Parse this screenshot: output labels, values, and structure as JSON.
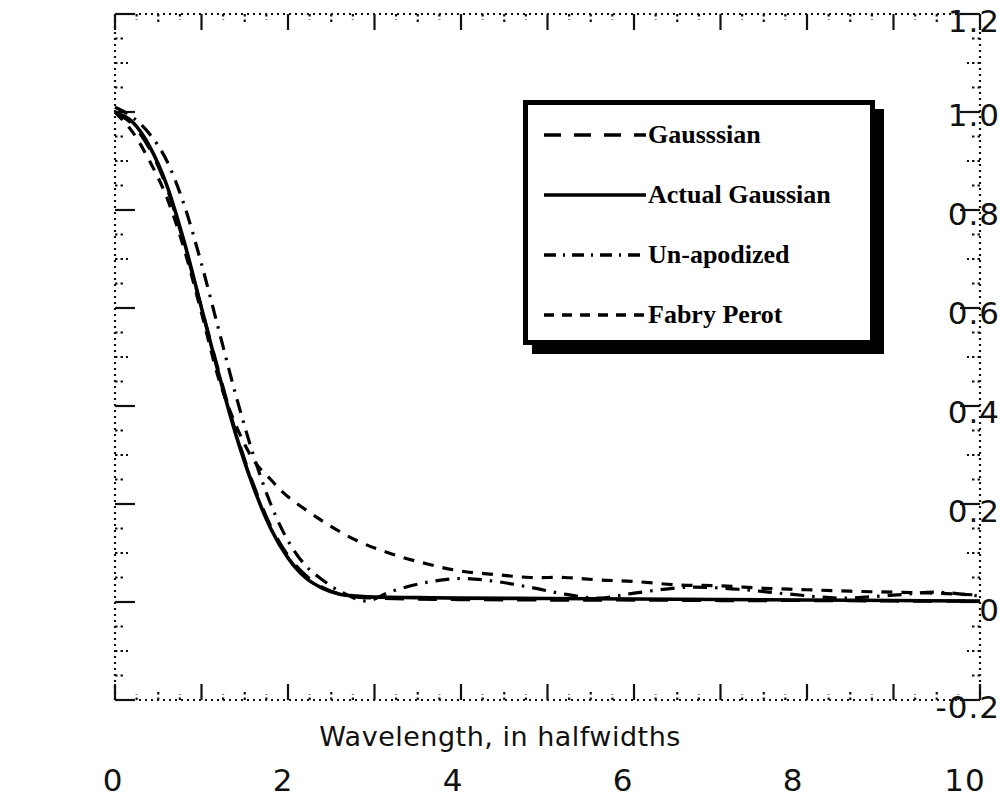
{
  "chart_data": {
    "type": "line",
    "title": "",
    "xlabel": "Wavelength, in halfwidths",
    "ylabel": "",
    "xlim": [
      0,
      10
    ],
    "ylim": [
      -0.2,
      1.2
    ],
    "xticks": [
      0,
      2,
      4,
      6,
      8,
      10
    ],
    "yticks": [
      -0.2,
      0,
      0.2,
      0.4,
      0.6,
      0.8,
      1.0,
      1.2
    ],
    "xtick_labels": [
      "0",
      "2",
      "4",
      "6",
      "8",
      "10"
    ],
    "ytick_labels": [
      "-0.2",
      "0",
      "0.2",
      "0.4",
      "0.6",
      "0.8",
      "1.0",
      "1.2"
    ],
    "grid": false,
    "frame": "dotted",
    "legend_position": "upper-right-inset",
    "series": [
      {
        "name": "Gausssian",
        "style": "long-dash",
        "x": [
          0,
          0.2,
          0.4,
          0.6,
          0.8,
          1.0,
          1.2,
          1.4,
          1.6,
          1.8,
          2.0,
          2.2,
          2.4,
          2.6,
          2.8,
          3.0,
          3.4,
          4.0,
          5.0,
          6.0,
          7.0,
          8.0,
          9.0,
          10.0
        ],
        "y": [
          1.0,
          0.975,
          0.925,
          0.845,
          0.73,
          0.6,
          0.47,
          0.345,
          0.24,
          0.155,
          0.095,
          0.055,
          0.03,
          0.016,
          0.01,
          0.008,
          0.006,
          0.005,
          0.004,
          0.004,
          0.003,
          0.003,
          0.002,
          0.002
        ]
      },
      {
        "name": "Actual Gaussian",
        "style": "solid",
        "x": [
          0,
          0.2,
          0.4,
          0.6,
          0.8,
          1.0,
          1.2,
          1.4,
          1.6,
          1.8,
          2.0,
          2.2,
          2.4,
          2.6,
          2.8,
          3.0,
          3.5,
          4.0,
          5.0,
          6.0,
          7.0,
          8.0,
          9.0,
          10.0
        ],
        "y": [
          1.0,
          0.98,
          0.93,
          0.85,
          0.735,
          0.6,
          0.465,
          0.34,
          0.235,
          0.15,
          0.09,
          0.05,
          0.028,
          0.016,
          0.012,
          0.01,
          0.009,
          0.008,
          0.007,
          0.006,
          0.005,
          0.004,
          0.003,
          0.002
        ]
      },
      {
        "name": "Un-apodized",
        "style": "dash-dot",
        "x": [
          0,
          0.2,
          0.4,
          0.6,
          0.8,
          1.0,
          1.2,
          1.4,
          1.6,
          1.8,
          2.0,
          2.2,
          2.4,
          2.6,
          2.9,
          3.2,
          3.6,
          4.0,
          4.4,
          4.8,
          5.2,
          5.6,
          6.0,
          6.6,
          7.2,
          7.8,
          8.4,
          9.0,
          9.5,
          10.0
        ],
        "y": [
          1.01,
          0.99,
          0.955,
          0.9,
          0.81,
          0.69,
          0.555,
          0.42,
          0.3,
          0.2,
          0.125,
          0.075,
          0.045,
          0.022,
          0.002,
          0.022,
          0.04,
          0.048,
          0.042,
          0.03,
          0.016,
          0.008,
          0.018,
          0.03,
          0.026,
          0.016,
          0.008,
          0.014,
          0.02,
          0.012
        ]
      },
      {
        "name": "Fabry Perot",
        "style": "short-dash",
        "x": [
          0,
          0.2,
          0.4,
          0.6,
          0.8,
          1.0,
          1.2,
          1.4,
          1.6,
          1.8,
          2.0,
          2.4,
          2.8,
          3.2,
          3.6,
          4.0,
          4.4,
          4.8,
          5.2,
          5.6,
          6.0,
          6.5,
          7.0,
          7.5,
          8.0,
          8.5,
          9.0,
          9.5,
          10.0
        ],
        "y": [
          1.0,
          0.96,
          0.9,
          0.825,
          0.72,
          0.59,
          0.455,
          0.36,
          0.29,
          0.25,
          0.215,
          0.165,
          0.125,
          0.098,
          0.078,
          0.063,
          0.056,
          0.05,
          0.05,
          0.045,
          0.042,
          0.035,
          0.033,
          0.028,
          0.025,
          0.022,
          0.02,
          0.018,
          0.014
        ]
      }
    ]
  },
  "axes": {
    "ytick_labels": [
      "1.2",
      "1.0",
      "0.8",
      "0.6",
      "0.4",
      "0.2",
      "0",
      "-0.2"
    ],
    "xtick_labels": [
      "0",
      "2",
      "4",
      "6",
      "8",
      "10"
    ],
    "xaxis_title": "Wavelength, in halfwidths"
  },
  "legend": {
    "entries": [
      {
        "label": "Gausssian",
        "style": "long-dash"
      },
      {
        "label": "Actual Gaussian",
        "style": "solid"
      },
      {
        "label": "Un-apodized",
        "style": "dash-dot"
      },
      {
        "label": "Fabry Perot",
        "style": "short-dash"
      }
    ]
  },
  "colors": {
    "ink": "#000000",
    "background": "#ffffff"
  }
}
